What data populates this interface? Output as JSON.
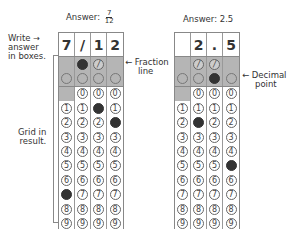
{
  "left_example": {
    "answer_prefix": "Answer:",
    "answer_numerator": "7",
    "answer_denominator": "12",
    "written": [
      "7",
      "/",
      "1",
      "2"
    ],
    "slash_row": [
      "",
      "filled",
      "slash",
      ""
    ],
    "decimal_row": [
      "empty",
      "empty",
      "empty",
      "empty"
    ],
    "zero_row_blank_col": 0,
    "filled_digits": {
      "0": 7,
      "2": 1,
      "3": 2
    },
    "digits": [
      "0",
      "1",
      "2",
      "3",
      "4",
      "5",
      "6",
      "7",
      "8",
      "9"
    ]
  },
  "right_example": {
    "answer_text": "Answer: 2.5",
    "written": [
      "",
      "2",
      ".",
      "5"
    ],
    "slash_row": [
      "",
      "slash",
      "slash",
      ""
    ],
    "decimal_row": [
      "empty",
      "empty",
      "filled",
      "empty"
    ],
    "zero_row_blank_col": 0,
    "filled_digits": {
      "1": 2,
      "3": 5
    },
    "digits": [
      "0",
      "1",
      "2",
      "3",
      "4",
      "5",
      "6",
      "7",
      "8",
      "9"
    ]
  },
  "annotations": {
    "write_answer": [
      "Write",
      "answer",
      "in boxes."
    ],
    "write_arrow": "→",
    "fraction_line": [
      "← Fraction",
      "line"
    ],
    "decimal_point": [
      "← Decimal",
      "point"
    ],
    "grid_in": [
      "Grid in",
      "result."
    ]
  },
  "colors": {
    "shade": "#b5b5b5",
    "filled_bubble": "#333333",
    "border": "#888888"
  }
}
